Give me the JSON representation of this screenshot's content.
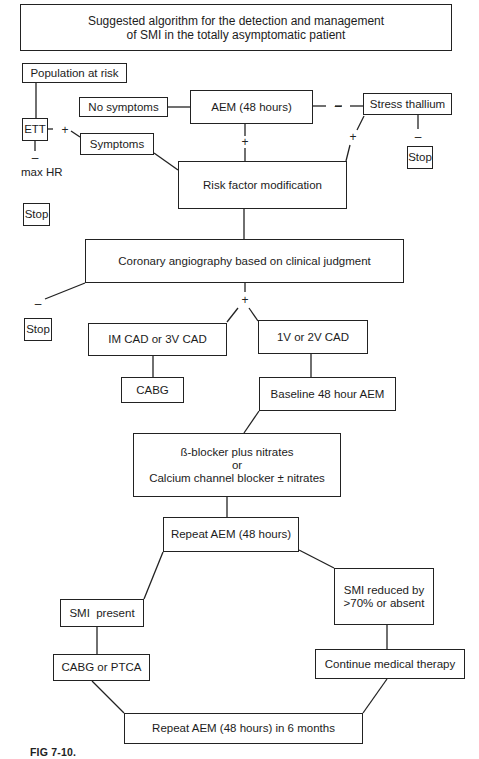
{
  "figure": {
    "title_line1": "Suggested algorithm for the detection and management",
    "title_line2": "of SMI in the totally asymptomatic patient",
    "caption": "FIG 7-10."
  },
  "nodes": {
    "population_at_risk": "Population at risk",
    "ett": "ETT",
    "no_symptoms": "No symptoms",
    "aem_48": "AEM (48 hours)",
    "stress_thallium": "Stress thallium",
    "symptoms": "Symptoms",
    "max_hr": "max HR",
    "stop": "Stop",
    "risk_factor_modification": "Risk factor modification",
    "coronary_angiography": "Coronary angiography based on clinical judgment",
    "im_cad_3v_cad": "IM CAD or 3V CAD",
    "v1_v2_cad": "1V or 2V CAD",
    "cabg": "CABG",
    "baseline_aem": "Baseline 48 hour AEM",
    "therapy_line1": "ß-blocker plus nitrates",
    "therapy_line2": "or",
    "therapy_line3": "Calcium channel blocker ± nitrates",
    "repeat_aem": "Repeat AEM (48 hours)",
    "smi_present": "SMI  present",
    "smi_reduced_line1": "SMI reduced by",
    "smi_reduced_line2": ">70% or absent",
    "cabg_or_ptca": "CABG or PTCA",
    "continue_medical_therapy": "Continue medical therapy",
    "repeat_aem_6_months": "Repeat AEM (48 hours) in 6 months"
  },
  "edge_labels": {
    "positive": "+",
    "negative": "–"
  }
}
